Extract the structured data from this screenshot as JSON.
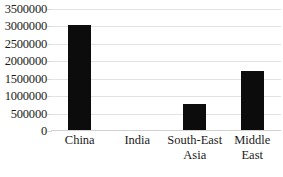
{
  "chart_data": {
    "type": "bar",
    "title": "",
    "subtitle": "",
    "xlabel": "",
    "ylabel": "",
    "categories": [
      "China",
      "India",
      "South-East Asia",
      "Middle East"
    ],
    "values": [
      3050000,
      0,
      760000,
      1700000
    ],
    "series": [
      {
        "name": "",
        "values": [
          3050000,
          0,
          760000,
          1700000
        ]
      }
    ],
    "ylim": [
      0,
      3500000
    ],
    "ytick_values": [
      0,
      500000,
      1000000,
      1500000,
      2000000,
      2500000,
      3000000,
      3500000
    ],
    "ytick_labels": [
      "0",
      "500000",
      "1000000",
      "1500000",
      "2000000",
      "2500000",
      "3000000",
      "3500000"
    ],
    "grid": true,
    "legend": false,
    "legend_position": "none",
    "bar_color": "#0c0c0c",
    "gridline_color": "#e3e3e3",
    "background_color": "#ffffff"
  },
  "axis": {
    "y_labels": [
      "3500000",
      "3000000",
      "2500000",
      "2000000",
      "1500000",
      "1000000",
      "500000",
      "0"
    ],
    "x_labels": [
      "China",
      "India",
      "South-East Asia",
      "Middle East"
    ]
  }
}
